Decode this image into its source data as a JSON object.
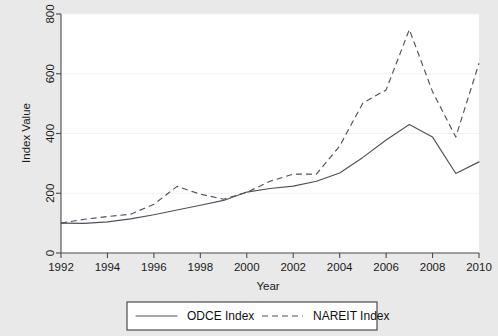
{
  "chart_data": {
    "type": "line",
    "title": "",
    "xlabel": "Year",
    "ylabel": "Index Value",
    "xlim": [
      1992,
      2010
    ],
    "ylim": [
      0,
      800
    ],
    "xticks": [
      1992,
      1994,
      1996,
      1998,
      2000,
      2002,
      2004,
      2006,
      2008,
      2010
    ],
    "xtick_labels": [
      "1992",
      "1994",
      "1996",
      "1998",
      "2000",
      "2002",
      "2004",
      "2006",
      "2008",
      "2010"
    ],
    "yticks": [
      0,
      200,
      400,
      600,
      800
    ],
    "ytick_labels": [
      "0",
      "200",
      "400",
      "600",
      "800"
    ],
    "grid": true,
    "legend_position": "bottom-outside",
    "x": [
      1992,
      1993,
      1994,
      1995,
      1996,
      1997,
      1998,
      1999,
      2000,
      2001,
      2002,
      2003,
      2004,
      2005,
      2006,
      2007,
      2008,
      2009,
      2010
    ],
    "series": [
      {
        "name": "ODCE Index",
        "style": "solid",
        "color": "#50505a",
        "values": [
          100,
          99,
          104,
          114,
          128,
          144,
          160,
          176,
          204,
          216,
          224,
          240,
          268,
          320,
          378,
          430,
          388,
          266,
          305
        ]
      },
      {
        "name": "NAREIT Index",
        "style": "dashed",
        "color": "#50505a",
        "values": [
          100,
          113,
          122,
          130,
          163,
          223,
          197,
          180,
          203,
          240,
          264,
          264,
          358,
          502,
          546,
          748,
          540,
          388,
          635
        ]
      }
    ]
  },
  "legend": {
    "items": [
      {
        "label": "ODCE Index",
        "style": "solid"
      },
      {
        "label": "NAREIT Index",
        "style": "dashed"
      }
    ]
  },
  "axes": {
    "x_title": "Year",
    "y_title": "Index Value"
  }
}
